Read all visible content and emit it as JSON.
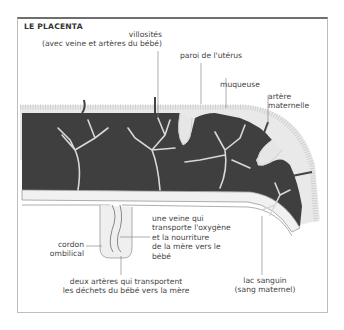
{
  "title": "LE PLACENTA",
  "labels": {
    "villosites": "villosités\n(avec veine et artères du bébé)",
    "paroi": "paroi de l'utérus",
    "muqueuse": "muqueuse",
    "artere_maternelle": "artère\nmaternelle",
    "veine": "une veine qui\ntransporte l'oxygène\net la nourriture\nde la mère vers le\nbébé",
    "cordon": "cordon\nombilical",
    "deux_arteres": "deux artères qui transportent\nles déchets du bébé vers la mère",
    "lac_sanguin": "lac sanguin\n(sang maternel)"
  },
  "colors": {
    "blood_lake": "#3f3f3f",
    "wall": "#e6e6e6",
    "frame_top": "#6e6e6e",
    "text": "#444444"
  }
}
